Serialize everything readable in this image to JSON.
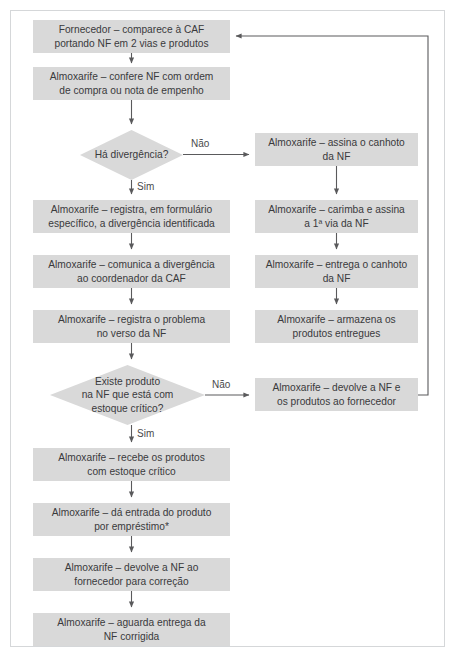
{
  "figure": {
    "type": "flowchart",
    "title_visible": false,
    "colors": {
      "node_fill": "#d9d9d9",
      "text": "#3a3a3c",
      "connector": "#5a5a5c",
      "frame_border": "#d5d7d9",
      "background": "#ffffff"
    }
  },
  "nodes": {
    "n1": "Fornecedor – comparece à CAF\nportando NF em 2 vias e produtos",
    "n2": "Almoxarife – confere NF com ordem\nde compra ou nota de empenho",
    "d1": "Há divergência?",
    "n3": "Almoxarife – registra, em formulário\nespecífico, a divergência identificada",
    "n4": "Almoxarife – comunica a divergência\nao coordenador da CAF",
    "n5": "Almoxarife – registra o problema\nno verso da NF",
    "d2": "Existe produto\nna NF que está com\nestoque crítico?",
    "n6": "Almoxarife – recebe os produtos\ncom estoque crítico",
    "n7": "Almoxarife – dá entrada do produto\npor empréstimo*",
    "n8": "Almoxarife – devolve a NF ao\nfornecedor para correção",
    "n9": "Almoxarife – aguarda entrega da\nNF corrigida",
    "r1": "Almoxarife – assina o canhoto\nda NF",
    "r2": "Almoxarife – carimba e assina\na 1ª via da NF",
    "r3": "Almoxarife – entrega o canhoto\nda NF",
    "r4": "Almoxarife – armazena os\nprodutos entregues",
    "r5": "Almoxarife – devolve a NF e\nos produtos ao fornecedor"
  },
  "edge_labels": {
    "d1_nao": "Não",
    "d1_sim": "Sim",
    "d2_nao": "Não",
    "d2_sim": "Sim"
  }
}
